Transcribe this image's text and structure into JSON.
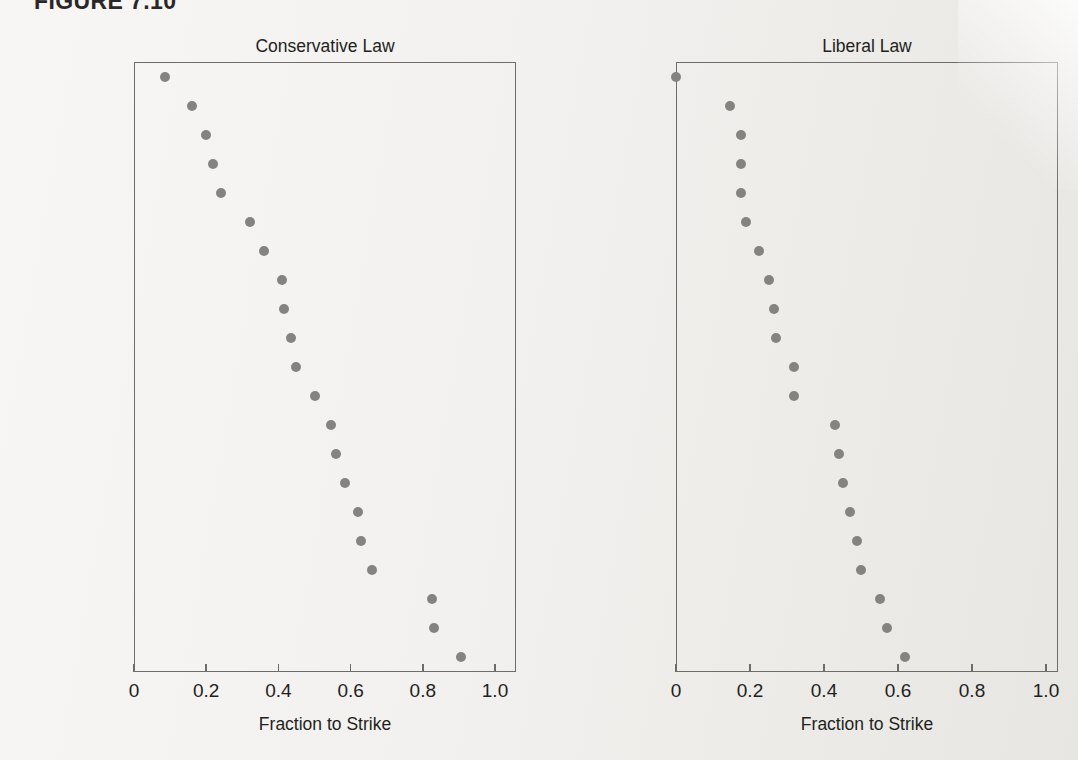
{
  "figure": {
    "label": "FIGURE 7.10"
  },
  "chart_data": [
    {
      "type": "scatter",
      "title": "Conservative Law",
      "xlabel": "Fraction to Strike",
      "ylabel": "",
      "xlim": [
        0,
        1.0
      ],
      "xticks": [
        0,
        0.2,
        0.4,
        0.6,
        0.8,
        1.0
      ],
      "xticklabels": [
        "0",
        "0.2",
        "0.4",
        "0.6",
        "0.8",
        "1.0"
      ],
      "grid": false,
      "legend": null,
      "categories": [
        "Alito",
        "Rehnquist",
        "Roberts",
        "Thomas",
        "Scalia",
        "Burger",
        "O’Connor",
        "Harlan",
        "Kennedy",
        "White",
        "Powell",
        "Stewart",
        "Blackmun",
        "Breyer",
        "Black",
        "Stevens",
        "Ginsburg",
        "Souter",
        "Brennan",
        "Marshall",
        "Douglas"
      ],
      "values": [
        0.085,
        0.16,
        0.2,
        0.22,
        0.24,
        0.32,
        0.36,
        0.41,
        0.415,
        0.435,
        0.45,
        0.5,
        0.545,
        0.56,
        0.585,
        0.62,
        0.63,
        0.66,
        0.825,
        0.83,
        0.905
      ]
    },
    {
      "type": "scatter",
      "title": "Liberal Law",
      "xlabel": "Fraction to Strike",
      "ylabel": "",
      "xlim": [
        0,
        1.0
      ],
      "xticks": [
        0,
        0.2,
        0.4,
        0.6,
        0.8,
        1.0
      ],
      "xticklabels": [
        "0",
        "0.2",
        "0.4",
        "0.6",
        "0.8",
        "1.0"
      ],
      "grid": false,
      "legend": null,
      "categories": [
        "Black",
        "Ginsburg",
        "Brennan",
        "Souter",
        "Marshall",
        "Breyer",
        "Douglas",
        "Stevens",
        "Blackmun",
        "White",
        "Powell",
        "Stewart",
        "Rehnquist",
        "Burger",
        "O’Connor",
        "Roberts",
        "Harlan",
        "Kennedy",
        "Scalia",
        "Alito",
        "Thomas"
      ],
      "values": [
        0.0,
        0.145,
        0.175,
        0.175,
        0.175,
        0.19,
        0.225,
        0.25,
        0.265,
        0.27,
        0.32,
        0.32,
        0.43,
        0.44,
        0.45,
        0.47,
        0.49,
        0.5,
        0.55,
        0.57,
        0.62
      ]
    }
  ],
  "colors": {
    "dot": "#85837f",
    "axis": "#6e6b68",
    "text": "#231f20",
    "page": "#f2f1ef"
  }
}
